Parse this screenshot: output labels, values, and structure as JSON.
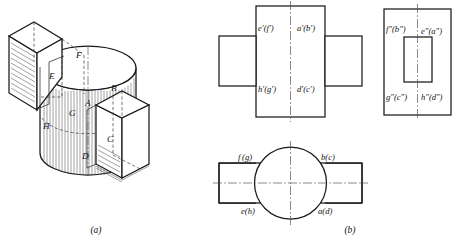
{
  "figure": {
    "title_a": "(a)",
    "title_b": "(b)",
    "background_color": "#ffffff",
    "line_color": "#1a1a1a",
    "hidden_line_color": "#3a3a3a",
    "center_line_color": "#4a4a4a",
    "hatch_color": "#555555"
  },
  "isometric": {
    "caption": "(a)",
    "description": "Cylinder with two rectangular slots cut through it, shown in isometric pictorial view with section hatching",
    "vertex_labels": [
      {
        "id": "label-F",
        "text": "F"
      },
      {
        "id": "label-E",
        "text": "E"
      },
      {
        "id": "label-B",
        "text": "B"
      },
      {
        "id": "label-A",
        "text": "A"
      },
      {
        "id": "label-G",
        "text": "G"
      },
      {
        "id": "label-H",
        "text": "H"
      },
      {
        "id": "label-C",
        "text": "C"
      },
      {
        "id": "label-D",
        "text": "D"
      }
    ]
  },
  "front_view": {
    "name": "front-view",
    "labels": [
      {
        "id": "front-top-left",
        "text": "e′(f′)"
      },
      {
        "id": "front-top-right",
        "text": "a′(b′)"
      },
      {
        "id": "front-bottom-left",
        "text": "h′(g′)"
      },
      {
        "id": "front-bottom-right",
        "text": "d′(c′)"
      }
    ]
  },
  "side_view": {
    "name": "left-side-view",
    "labels": [
      {
        "id": "side-top-left",
        "text": "f″(b″)"
      },
      {
        "id": "side-top-right",
        "text": "e″(a″)"
      },
      {
        "id": "side-bottom-left",
        "text": "g″(c″)"
      },
      {
        "id": "side-bottom-right",
        "text": "h″(d″)"
      }
    ]
  },
  "top_view": {
    "name": "top-view",
    "labels": [
      {
        "id": "top-left-upper",
        "text": "f (g)"
      },
      {
        "id": "top-right-upper",
        "text": "b(c)"
      },
      {
        "id": "top-left-lower",
        "text": "e(h)"
      },
      {
        "id": "top-right-lower",
        "text": "a(d)"
      }
    ]
  }
}
